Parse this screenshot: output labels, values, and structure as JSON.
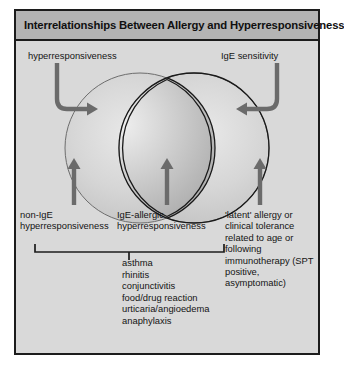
{
  "figure": {
    "title": "Interrelationships Between Allergy and Hyperresponsiveness",
    "colors": {
      "panel_background": "#d9d9d9",
      "title_background": "#b4b4b4",
      "border": "#1c1c1c",
      "arrow": "#6b6b6b",
      "circle_outline": "#555555",
      "lens_outline": "#1a1a1a",
      "text": "#141414"
    },
    "labels": {
      "top_left": "hyperresponsiveness",
      "top_right": "IgE sensitivity",
      "bottom_left": "non-IgE\nhyperresponsiveness",
      "bottom_center": "IgE-allergic\nhyperresponsiveness",
      "bottom_right": "'latent' allergy or clinical tolerance related to age or following immunotherapy (SPT positive, asymptomatic)"
    },
    "conditions": [
      "asthma",
      "rhinitis",
      "conjunctivitis",
      "food/drug reaction",
      "urticaria/angioedema",
      "anaphylaxis"
    ],
    "diagram": {
      "type": "venn-two-circle",
      "left_circle": "non-IgE hyperresponsiveness",
      "right_circle": "IgE sensitivity",
      "intersection": "IgE-allergic hyperresponsiveness",
      "arrows": [
        "curved-arrow-to-left-circle",
        "curved-arrow-to-right-circle",
        "up-arrow-left",
        "up-arrow-center",
        "up-arrow-right"
      ]
    }
  }
}
